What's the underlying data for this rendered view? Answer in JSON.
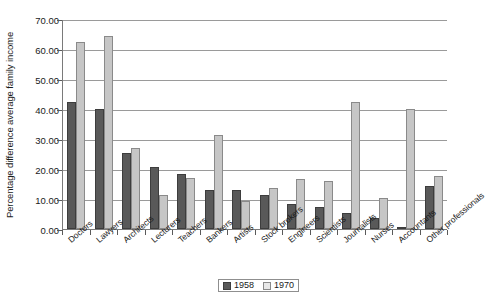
{
  "chart_data": {
    "type": "bar",
    "title": "",
    "xlabel": "",
    "ylabel": "Percentage difference average family income",
    "ylim": [
      0,
      70
    ],
    "ytick_step": 10,
    "ytick_labels": [
      "0.00",
      "10.00",
      "20.00",
      "30.00",
      "40.00",
      "50.00",
      "60.00",
      "70.00"
    ],
    "grid": true,
    "legend_position": "bottom",
    "categories": [
      "Doctors",
      "Lawyers",
      "Architects",
      "Lecturers",
      "Teachers",
      "Bankers",
      "Artists",
      "Stock brokers",
      "Engineers",
      "Scientists",
      "Journalists",
      "Nurses",
      "Accountants",
      "Other professionals"
    ],
    "series": [
      {
        "name": "1958",
        "color": "#595959",
        "values": [
          42.5,
          40.0,
          25.2,
          20.8,
          18.2,
          13.0,
          13.0,
          11.5,
          8.5,
          7.5,
          5.5,
          3.8,
          0.5,
          14.3
        ]
      },
      {
        "name": "1970",
        "color": "#c6c6c6",
        "values": [
          62.5,
          64.3,
          27.0,
          11.5,
          17.0,
          31.3,
          9.5,
          13.8,
          16.8,
          16.0,
          42.5,
          10.5,
          40.0,
          17.7
        ]
      }
    ]
  },
  "legend": {
    "items": [
      {
        "label": "1958"
      },
      {
        "label": "1970"
      }
    ]
  }
}
